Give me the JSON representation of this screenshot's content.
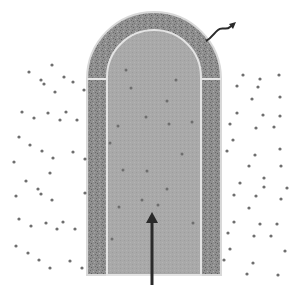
{
  "diagram": {
    "colors": {
      "background": "#ffffff",
      "wall": "#8f8f8f",
      "wall_edge": "#d8d8d8",
      "lumen": "#a9a9a9",
      "particle": "#6e6e6e",
      "arrow": "#2a2a2a"
    },
    "tube": {
      "outer": {
        "x": 87,
        "y": 12,
        "width": 134,
        "height": 263,
        "radius": 67
      },
      "inner": {
        "x": 107,
        "y": 30,
        "width": 94,
        "height": 245,
        "radius": 47
      }
    },
    "arrows": {
      "inflow": {
        "x": 152,
        "y1": 285,
        "y2": 212,
        "direction": "up"
      },
      "outflow": {
        "path": "M206,41 C212,38 214,33 218,30 C222,26 226,31 230,27 L234,24",
        "direction": "up-right",
        "style": "wavy"
      }
    },
    "particles_outside": [
      [
        52,
        65
      ],
      [
        29,
        72
      ],
      [
        41,
        80
      ],
      [
        44,
        84
      ],
      [
        64,
        77
      ],
      [
        73,
        82
      ],
      [
        55,
        92
      ],
      [
        84,
        90
      ],
      [
        22,
        112
      ],
      [
        34,
        118
      ],
      [
        48,
        113
      ],
      [
        66,
        112
      ],
      [
        60,
        120
      ],
      [
        77,
        120
      ],
      [
        19,
        137
      ],
      [
        30,
        145
      ],
      [
        42,
        151
      ],
      [
        73,
        152
      ],
      [
        53,
        158
      ],
      [
        85,
        159
      ],
      [
        14,
        162
      ],
      [
        50,
        173
      ],
      [
        26,
        181
      ],
      [
        38,
        189
      ],
      [
        41,
        194
      ],
      [
        16,
        196
      ],
      [
        52,
        200
      ],
      [
        85,
        193
      ],
      [
        19,
        219
      ],
      [
        31,
        226
      ],
      [
        46,
        223
      ],
      [
        63,
        222
      ],
      [
        57,
        229
      ],
      [
        75,
        229
      ],
      [
        16,
        246
      ],
      [
        28,
        253
      ],
      [
        39,
        260
      ],
      [
        70,
        261
      ],
      [
        50,
        268
      ],
      [
        82,
        268
      ],
      [
        243,
        75
      ],
      [
        260,
        79
      ],
      [
        279,
        75
      ],
      [
        237,
        86
      ],
      [
        258,
        87
      ],
      [
        252,
        99
      ],
      [
        280,
        97
      ],
      [
        237,
        113
      ],
      [
        263,
        115
      ],
      [
        280,
        116
      ],
      [
        230,
        124
      ],
      [
        256,
        128
      ],
      [
        274,
        127
      ],
      [
        233,
        140
      ],
      [
        227,
        151
      ],
      [
        255,
        155
      ],
      [
        280,
        149
      ],
      [
        249,
        166
      ],
      [
        281,
        166
      ],
      [
        264,
        178
      ],
      [
        240,
        183
      ],
      [
        264,
        187
      ],
      [
        287,
        188
      ],
      [
        234,
        195
      ],
      [
        256,
        196
      ],
      [
        281,
        199
      ],
      [
        249,
        208
      ],
      [
        234,
        222
      ],
      [
        260,
        224
      ],
      [
        277,
        224
      ],
      [
        228,
        233
      ],
      [
        254,
        236
      ],
      [
        271,
        236
      ],
      [
        230,
        249
      ],
      [
        285,
        251
      ],
      [
        224,
        260
      ],
      [
        253,
        263
      ],
      [
        247,
        274
      ],
      [
        278,
        275
      ]
    ],
    "particles_inside": [
      [
        126,
        70
      ],
      [
        131,
        88
      ],
      [
        176,
        80
      ],
      [
        167,
        101
      ],
      [
        146,
        117
      ],
      [
        169,
        124
      ],
      [
        192,
        122
      ],
      [
        118,
        126
      ],
      [
        110,
        143
      ],
      [
        123,
        170
      ],
      [
        147,
        171
      ],
      [
        182,
        154
      ],
      [
        167,
        189
      ],
      [
        142,
        200
      ],
      [
        119,
        207
      ],
      [
        158,
        205
      ],
      [
        112,
        239
      ],
      [
        193,
        223
      ]
    ]
  }
}
